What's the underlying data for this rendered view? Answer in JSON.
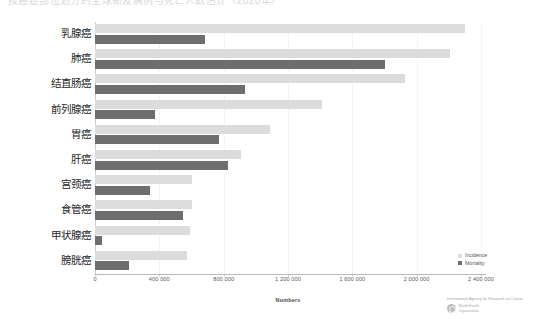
{
  "top_strip": {
    "ghost_text": "按癌症部位划分的全球新发病例与死亡人数估计（2020年）"
  },
  "legend": {
    "position": "bottom-right",
    "items": [
      {
        "label": "Incidence",
        "color": "#dcdcdc",
        "name": "incidence"
      },
      {
        "label": "Mortality",
        "color": "#6e6e6e",
        "name": "mortality"
      }
    ]
  },
  "credit": {
    "line1": "International Agency for Research on Cancer",
    "who_line1": "World Health",
    "who_line2": "Organization"
  },
  "chart_data": {
    "type": "bar",
    "orientation": "horizontal",
    "title": "",
    "subtitle": "",
    "xlabel": "Numbers",
    "ylabel": "",
    "xlim": [
      0,
      2400000
    ],
    "grid": false,
    "legend_position": "bottom-right",
    "xticks": [
      0,
      400000,
      800000,
      1200000,
      1600000,
      2000000,
      2400000
    ],
    "xtick_labels": [
      "0",
      "400 000",
      "800 000",
      "1 200 000",
      "1 600 000",
      "2 000 000",
      "2 400 000"
    ],
    "categories": [
      "乳腺癌",
      "肺癌",
      "结直肠癌",
      "前列腺癌",
      "胃癌",
      "肝癌",
      "宫颈癌",
      "食管癌",
      "甲状腺癌",
      "膀胱癌"
    ],
    "series": [
      {
        "name": "Incidence",
        "color": "#dcdcdc",
        "values": [
          2300000,
          2210000,
          1930000,
          1410000,
          1090000,
          910000,
          600000,
          600000,
          590000,
          570000
        ]
      },
      {
        "name": "Mortality",
        "color": "#6e6e6e",
        "values": [
          685000,
          1800000,
          935000,
          375000,
          770000,
          830000,
          340000,
          545000,
          45000,
          210000
        ]
      }
    ]
  }
}
